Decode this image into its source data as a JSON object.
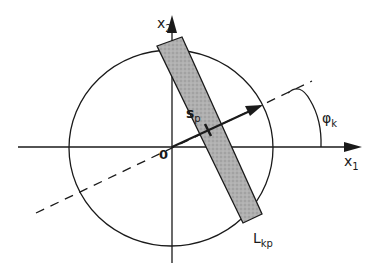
{
  "diagram": {
    "axes": {
      "x_label": "x",
      "x_sub": "1",
      "y_label": "x",
      "y_sub": "2",
      "origin_label": "0"
    },
    "strip": {
      "label": "L",
      "label_sub": "kp",
      "fill": "#a8a8a8"
    },
    "vector": {
      "label": "s",
      "label_sub": "p"
    },
    "angle": {
      "label": "φ",
      "label_sub": "k"
    },
    "colors": {
      "line": "#1a1a1a",
      "background": "#ffffff"
    }
  }
}
